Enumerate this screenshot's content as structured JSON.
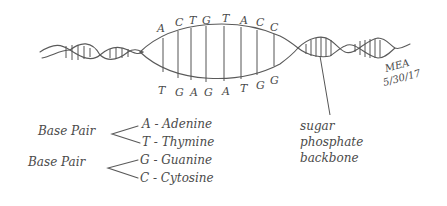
{
  "diagram": {
    "top_strand_bases": [
      "A",
      "C",
      "T",
      "G",
      "T",
      "A",
      "C",
      "C"
    ],
    "bottom_strand_bases": [
      "T",
      "G",
      "A",
      "G",
      "A",
      "T",
      "G",
      "G"
    ],
    "signature": {
      "initials": "MEA",
      "date": "5/30/17"
    },
    "backbone_label": {
      "line1": "sugar",
      "line2": "phosphate",
      "line3": "backbone"
    },
    "legend": {
      "groups": [
        {
          "label": "Base Pair",
          "items": [
            "A - Adenine",
            "T - Thymine"
          ]
        },
        {
          "label": "Base Pair",
          "items": [
            "G - Guanine",
            "C - Cytosine"
          ]
        }
      ]
    },
    "colors": {
      "ink": "#555555",
      "background": "#ffffff"
    }
  }
}
